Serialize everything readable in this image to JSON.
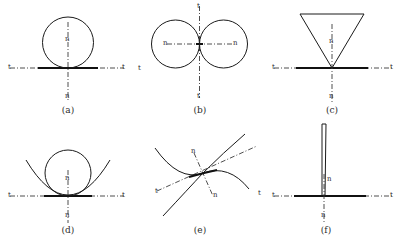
{
  "figure": {
    "background_color": "#ffffff",
    "line_color": "#1a1a1a",
    "dashdot_color": "#3a3a3a",
    "tangent_symbol": "t",
    "normal_symbol": "n"
  },
  "panels": [
    {
      "id": "a",
      "caption": "(a)",
      "description": "circle tangent to horizontal line from above",
      "labels": {
        "tangent_left": "t",
        "tangent_right": "t",
        "normal_up": "n",
        "normal_down": "n"
      }
    },
    {
      "id": "b",
      "caption": "(b)",
      "description": "two equal circles tangent to each other with vertical tangent line",
      "labels": {
        "tangent_top": "t",
        "tangent_bottom": "t",
        "tangent_left": "t",
        "normal_left": "n",
        "normal_right": "n"
      }
    },
    {
      "id": "c",
      "caption": "(c)",
      "description": "inverted triangle with apex touching horizontal tangent line",
      "labels": {
        "tangent_left": "t",
        "tangent_right": "t",
        "normal_up": "n",
        "normal_down": "n"
      }
    },
    {
      "id": "d",
      "caption": "(d)",
      "description": "circle inscribed in upward parabola, both tangent to horizontal line",
      "labels": {
        "tangent_left": "t",
        "tangent_right": "t",
        "normal_up": "n",
        "normal_down": "n"
      }
    },
    {
      "id": "e",
      "caption": "(e)",
      "description": "two curves in tangential contact with inclined tangent and normal",
      "labels": {
        "tangent_lower_left": "t",
        "tangent_right": "t",
        "normal_up": "n",
        "normal_down": "n"
      }
    },
    {
      "id": "f",
      "caption": "(f)",
      "description": "narrow vertical sliver meeting horizontal tangent line",
      "labels": {
        "tangent_left": "t",
        "tangent_right": "t",
        "normal_up": "n",
        "normal_down": "n"
      }
    }
  ]
}
